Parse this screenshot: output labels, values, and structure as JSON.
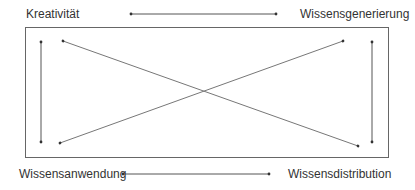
{
  "diagram": {
    "nodes": {
      "top_left": "Kreativität",
      "top_right": "Wissensgenerierung",
      "bottom_left": "Wissensanwendung",
      "bottom_right": "Wissensdistribution"
    },
    "edges": [
      {
        "from": "Kreativität",
        "to": "Wissensgenerierung",
        "type": "bidirectional",
        "position": "top-horizontal"
      },
      {
        "from": "Wissensanwendung",
        "to": "Wissensdistribution",
        "type": "bidirectional",
        "position": "bottom-horizontal"
      },
      {
        "from": "Kreativität",
        "to": "Wissensanwendung",
        "type": "bidirectional",
        "position": "left-vertical"
      },
      {
        "from": "Wissensgenerierung",
        "to": "Wissensdistribution",
        "type": "bidirectional",
        "position": "right-vertical"
      },
      {
        "from": "Kreativität",
        "to": "Wissensdistribution",
        "type": "bidirectional",
        "position": "diagonal"
      },
      {
        "from": "Wissensanwendung",
        "to": "Wissensgenerierung",
        "type": "bidirectional",
        "position": "diagonal"
      }
    ],
    "colors": {
      "line": "#555555",
      "text": "#333333",
      "frame": "#666666"
    }
  }
}
